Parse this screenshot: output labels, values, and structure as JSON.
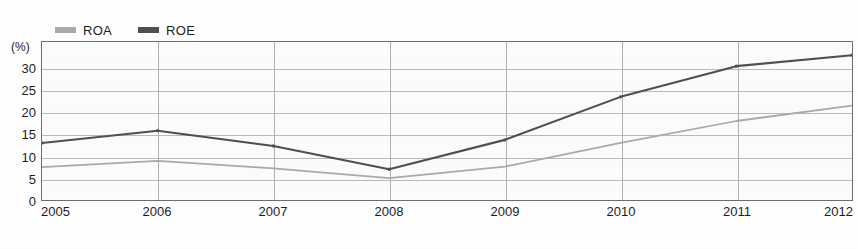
{
  "chart_data": {
    "type": "line",
    "title": "",
    "xlabel": "",
    "ylabel": "(%)",
    "unit_label": "(%)",
    "categories": [
      "2005",
      "2006",
      "2007",
      "2008",
      "2009",
      "2010",
      "2011",
      "2012"
    ],
    "x": [
      2005,
      2006,
      2007,
      2008,
      2009,
      2010,
      2011,
      2012
    ],
    "xlim": [
      2005,
      2012
    ],
    "ylim": [
      0,
      36
    ],
    "yticks": [
      0,
      5,
      10,
      15,
      20,
      25,
      30
    ],
    "ytick_labels": [
      "0",
      "5",
      "10",
      "15",
      "20",
      "25",
      "30"
    ],
    "grid": true,
    "legend_position": "top-left",
    "series": [
      {
        "name": "ROA",
        "color": "#a9a9a9",
        "values": [
          7.5,
          8.9,
          7.2,
          5.0,
          7.6,
          13.0,
          18.0,
          21.5
        ]
      },
      {
        "name": "ROE",
        "color": "#4f4f4f",
        "values": [
          13.0,
          15.8,
          12.3,
          7.0,
          13.7,
          23.5,
          30.5,
          33.0
        ]
      }
    ]
  },
  "legend": {
    "items": [
      {
        "label": "ROA",
        "color": "#a9a9a9"
      },
      {
        "label": "ROE",
        "color": "#4f4f4f"
      }
    ]
  },
  "axes": {
    "unit": "(%)",
    "y_labels": [
      "30",
      "25",
      "20",
      "15",
      "10",
      "5",
      "0"
    ],
    "x_labels": [
      "2005",
      "2006",
      "2007",
      "2008",
      "2009",
      "2010",
      "2011",
      "2012"
    ]
  },
  "colors": {
    "roa": "#a9a9a9",
    "roe": "#4f4f4f",
    "grid": "#b9b9b9",
    "frame": "#6d6d6d",
    "background": "#fbfbfb",
    "text": "#1d1d1d"
  }
}
